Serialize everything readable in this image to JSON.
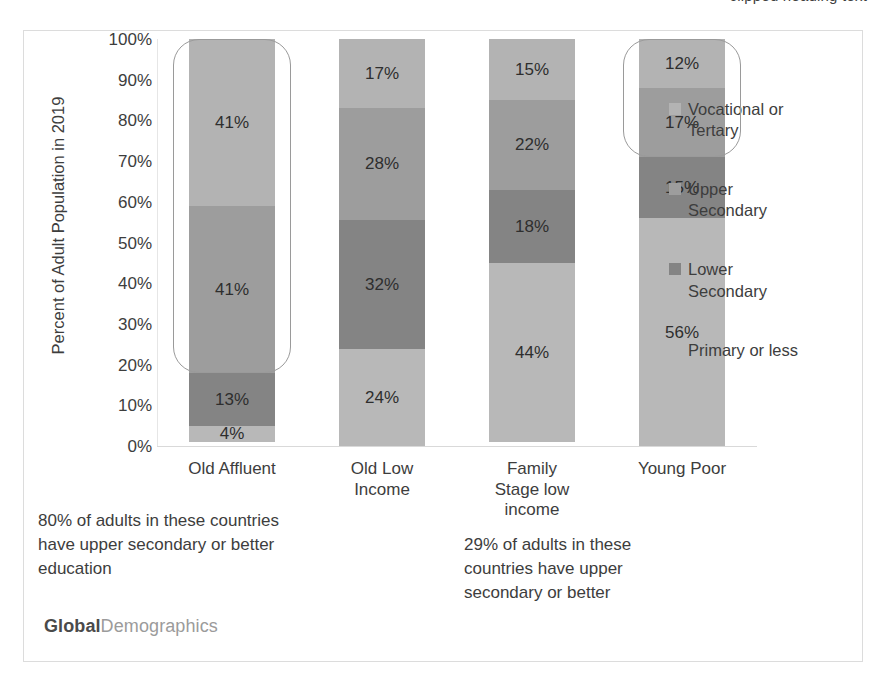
{
  "top_caption": "clipped heading text",
  "footer": {
    "brand_strong": "Global",
    "brand_light": "Demographics"
  },
  "chart_data": {
    "type": "bar",
    "subtype": "stacked-100-percent",
    "title": "",
    "xlabel": "",
    "ylabel": "Percent of Adult Population in 2019",
    "ylim": [
      0,
      100
    ],
    "ytick_labels": [
      "100%",
      "90%",
      "80%",
      "70%",
      "60%",
      "50%",
      "40%",
      "30%",
      "20%",
      "10%",
      "0%"
    ],
    "ytick_values": [
      100,
      90,
      80,
      70,
      60,
      50,
      40,
      30,
      20,
      10,
      0
    ],
    "grid": false,
    "legend_position": "right",
    "categories": [
      "Old Affluent",
      "Old Low Income",
      "Family Stage low income",
      "Young Poor"
    ],
    "category_lines": [
      [
        "Old Affluent"
      ],
      [
        "Old Low",
        "Income"
      ],
      [
        "Family",
        "Stage low",
        "income"
      ],
      [
        "Young Poor"
      ]
    ],
    "series": [
      {
        "name": "Vocational or Tertary",
        "name_lines": [
          "Vocational or",
          "Tertary"
        ],
        "color": "#b3b3b3",
        "values": [
          41,
          17,
          15,
          12
        ],
        "labels": [
          "41%",
          "17%",
          "15%",
          "12%"
        ]
      },
      {
        "name": "Upper Secondary",
        "name_lines": [
          "Upper",
          "Secondary"
        ],
        "color": "#9d9d9d",
        "values": [
          41,
          28,
          22,
          17
        ],
        "labels": [
          "41%",
          "28%",
          "22%",
          "17%"
        ]
      },
      {
        "name": "Lower Secondary",
        "name_lines": [
          "Lower",
          "Secondary"
        ],
        "color": "#848484",
        "values": [
          13,
          32,
          18,
          15
        ],
        "labels": [
          "13%",
          "32%",
          "18%",
          "15%"
        ]
      },
      {
        "name": "Primary or less",
        "name_lines": [
          "Primary or less"
        ],
        "color": "#b8b8b8",
        "values": [
          4,
          24,
          44,
          56
        ],
        "labels": [
          "4%",
          "24%",
          "44%",
          "56%"
        ]
      }
    ],
    "annotations": [
      {
        "id": "annot-old-affluent",
        "text": "80% of adults in these countries have upper secondary or better education",
        "lines": [
          "80% of adults in these countries",
          "have upper secondary or better",
          "education"
        ],
        "target_category": "Old Affluent",
        "bracket_span_percent": [
          18,
          100
        ]
      },
      {
        "id": "annot-young-poor",
        "text": "29% of adults in these countries have upper secondary or better",
        "lines": [
          "29% of adults in these",
          "countries have upper",
          "secondary or better"
        ],
        "target_category": "Young Poor",
        "bracket_span_percent": [
          71,
          100
        ]
      }
    ]
  }
}
